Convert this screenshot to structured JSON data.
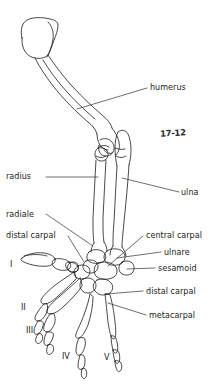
{
  "figure": {
    "kind": "anatomical-line-drawing",
    "figure_number": "17-12",
    "background_color": "#ffffff",
    "ink_color": "#1a1a1a",
    "leader_color": "#303030"
  },
  "labels": [
    {
      "id": "humerus",
      "text": "humerus",
      "side": "right",
      "x": 150,
      "y": 83,
      "leader": [
        [
          129,
          88
        ],
        [
          147,
          88
        ]
      ]
    },
    {
      "id": "radius",
      "text": "radius",
      "side": "left",
      "x": 6,
      "y": 172,
      "leader": [
        [
          46,
          177
        ],
        [
          98,
          177
        ]
      ]
    },
    {
      "id": "ulna",
      "text": "ulna",
      "side": "right",
      "x": 182,
      "y": 189,
      "leader": [
        [
          122,
          178
        ],
        [
          179,
          194
        ]
      ]
    },
    {
      "id": "radiale",
      "text": "radiale",
      "side": "left",
      "x": 6,
      "y": 211,
      "leader": [
        [
          45,
          215
        ],
        [
          92,
          244
        ]
      ]
    },
    {
      "id": "distal-carpal-upper",
      "text": "distal carpal",
      "side": "left",
      "x": 6,
      "y": 232,
      "leader": [
        [
          67,
          236
        ],
        [
          89,
          253
        ]
      ]
    },
    {
      "id": "central-carpal",
      "text": "central carpal",
      "side": "right",
      "x": 146,
      "y": 234,
      "leader": [
        [
          118,
          249
        ],
        [
          143,
          238
        ]
      ]
    },
    {
      "id": "ulnare",
      "text": "ulnare",
      "side": "right",
      "x": 164,
      "y": 253,
      "leader": [
        [
          117,
          257
        ],
        [
          161,
          257
        ]
      ]
    },
    {
      "id": "sesamoid",
      "text": "sesamoid",
      "side": "right",
      "x": 158,
      "y": 268,
      "leader": [
        [
          119,
          266
        ],
        [
          155,
          271
        ]
      ]
    },
    {
      "id": "distal-carpal-lower",
      "text": "distal carpal",
      "side": "right",
      "x": 146,
      "y": 291,
      "leader": [
        [
          113,
          292
        ],
        [
          143,
          294
        ]
      ]
    },
    {
      "id": "metacarpal",
      "text": "metacarpal",
      "side": "right",
      "x": 149,
      "y": 314,
      "leader": [
        [
          110,
          303
        ],
        [
          146,
          317
        ]
      ]
    }
  ],
  "digits": [
    {
      "id": "digit-I",
      "text": "I",
      "x": 10,
      "y": 264
    },
    {
      "id": "digit-II",
      "text": "II",
      "x": 21,
      "y": 307
    },
    {
      "id": "digit-III",
      "text": "III",
      "x": 26,
      "y": 330
    },
    {
      "id": "digit-IV",
      "text": "IV",
      "x": 62,
      "y": 356
    },
    {
      "id": "digit-V",
      "text": "V",
      "x": 104,
      "y": 357
    }
  ],
  "figure_number_pos": {
    "x": 160,
    "y": 128
  }
}
